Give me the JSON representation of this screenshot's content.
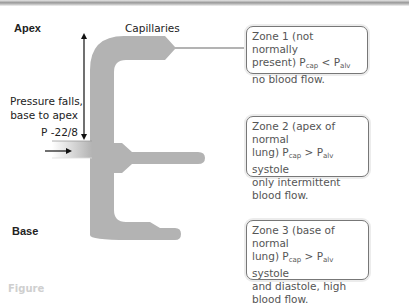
{
  "labels": {
    "apex": "Apex",
    "base": "Base",
    "capillaries": "Capillaries",
    "pressure_line1": "Pressure falls,",
    "pressure_line2": "base to apex",
    "pressure_value": "P  -22/8"
  },
  "zones": [
    {
      "id": "zone1",
      "line1": "Zone 1 (not normally",
      "line2_pre": "present) P",
      "sub1": "cap",
      "mid": " < P",
      "sub2": "alv",
      "line2_post": "",
      "line3": "no blood flow.",
      "line4": ""
    },
    {
      "id": "zone2",
      "line1": "Zone 2 (apex of normal",
      "line2_pre": "lung) P",
      "sub1": "cap",
      "mid": " > P",
      "sub2": "alv",
      "line2_post": " systole",
      "line3": "only intermittent",
      "line4": "blood flow."
    },
    {
      "id": "zone3",
      "line1": "Zone 3 (base of normal",
      "line2_pre": "lung) P",
      "sub1": "cap",
      "mid": " > P",
      "sub2": "alv",
      "line2_post": " systole",
      "line3": "and diastole, high",
      "line4": "blood flow."
    }
  ],
  "caption": "Figure",
  "colors": {
    "vessel": "#b3b3b3",
    "border": "#777777",
    "text": "#555555"
  }
}
